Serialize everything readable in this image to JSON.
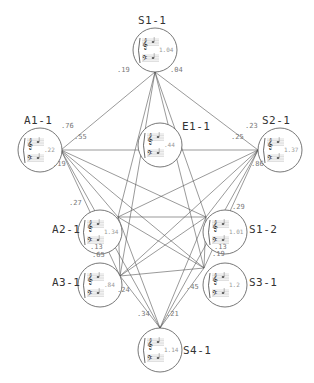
{
  "diagram": {
    "type": "network",
    "nodes": [
      {
        "id": "S1-1",
        "label": "S1-1",
        "value": "1.04",
        "cx": 155,
        "cy": 50
      },
      {
        "id": "A1-1",
        "label": "A1-1",
        "value": ".22",
        "cx": 40,
        "cy": 150
      },
      {
        "id": "E1-1",
        "label": "E1-1",
        "value": ".44",
        "cx": 160,
        "cy": 145
      },
      {
        "id": "S2-1",
        "label": "S2-1",
        "value": "1.37",
        "cx": 280,
        "cy": 150
      },
      {
        "id": "A2-1",
        "label": "A2-1",
        "value": "1.34",
        "cx": 100,
        "cy": 232
      },
      {
        "id": "S1-2",
        "label": "S1-2",
        "value": "1.01",
        "cx": 225,
        "cy": 232
      },
      {
        "id": "A3-1",
        "label": "A3-1",
        "value": ".84",
        "cx": 100,
        "cy": 285
      },
      {
        "id": "S3-1",
        "label": "S3-1",
        "value": "1.2",
        "cx": 225,
        "cy": 285
      },
      {
        "id": "S4-1",
        "label": "S4-1",
        "value": "1.14",
        "cx": 160,
        "cy": 350
      }
    ],
    "weights": [
      {
        "text": ".19",
        "x": 117,
        "y": 73
      },
      {
        "text": ".04",
        "x": 170,
        "y": 73
      },
      {
        "text": ".76",
        "x": 61,
        "y": 129
      },
      {
        "text": ".55",
        "x": 74,
        "y": 140
      },
      {
        "text": ".19",
        "x": 53,
        "y": 167
      },
      {
        "text": ".23",
        "x": 245,
        "y": 129
      },
      {
        "text": ".25",
        "x": 231,
        "y": 140
      },
      {
        "text": ".86",
        "x": 251,
        "y": 167
      },
      {
        "text": ".27",
        "x": 69,
        "y": 206
      },
      {
        "text": ".29",
        "x": 232,
        "y": 210
      },
      {
        "text": ".13",
        "x": 90,
        "y": 250
      },
      {
        "text": ".65",
        "x": 92,
        "y": 258
      },
      {
        "text": ".13",
        "x": 214,
        "y": 250
      },
      {
        "text": ".19",
        "x": 212,
        "y": 257
      },
      {
        "text": ".24",
        "x": 117,
        "y": 293
      },
      {
        "text": ".45",
        "x": 186,
        "y": 290
      },
      {
        "text": ".34",
        "x": 137,
        "y": 317
      },
      {
        "text": ".21",
        "x": 166,
        "y": 317
      }
    ]
  }
}
